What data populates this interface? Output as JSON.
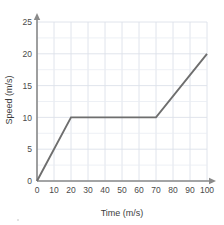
{
  "chart_data": {
    "type": "line",
    "title": "",
    "xlabel": "Time (m/s)",
    "ylabel": "Speed (m/s)",
    "xlim": [
      0,
      105
    ],
    "ylim": [
      0,
      26.5
    ],
    "xticks": [
      0,
      10,
      20,
      30,
      40,
      50,
      60,
      70,
      80,
      90,
      100
    ],
    "yticks": [
      0,
      5,
      10,
      15,
      20,
      25
    ],
    "xtick_labels": [
      "0",
      "10",
      "20",
      "30",
      "40",
      "50",
      "60",
      "70",
      "80",
      "90",
      "100"
    ],
    "ytick_labels": [
      "0",
      "5",
      "10",
      "15",
      "20",
      "25"
    ],
    "x_grid_step": 10,
    "y_grid_step": 2.5,
    "grid": true,
    "legend": "none",
    "series": [
      {
        "name": "speed",
        "color": "#6e6e6e",
        "x": [
          0,
          20,
          70,
          100
        ],
        "y": [
          0,
          10,
          10,
          20
        ],
        "points": [
          {
            "x": 0,
            "y": 0
          },
          {
            "x": 20,
            "y": 10
          },
          {
            "x": 70,
            "y": 10
          },
          {
            "x": 100,
            "y": 20
          }
        ]
      }
    ],
    "annotations": [],
    "axis_arrows": {
      "x_end": true,
      "y_end": true
    }
  },
  "colors": {
    "background": "#ffffff",
    "grid_minor": "#e9ecf2",
    "grid_major": "#dde1ea",
    "axis": "#8a8a8a",
    "series": "#6e6e6e",
    "tick_text": "#4a4a4a",
    "axis_title_text": "#3c3c3c"
  }
}
